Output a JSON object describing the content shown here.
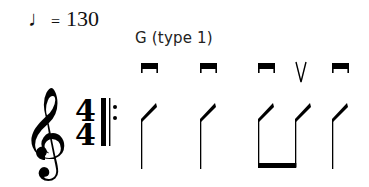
{
  "tempo": {
    "note_symbol": "♩",
    "equals": "=",
    "bpm": "130"
  },
  "chord": {
    "label": "G (type 1)"
  },
  "staff": {
    "clef": "treble-clef",
    "time_signature": {
      "top": "4",
      "bottom": "4"
    },
    "barline": "start-repeat"
  },
  "pattern": {
    "notation": "slash",
    "strokes": [
      {
        "index": 1,
        "direction": "down",
        "symbol": "down-bow",
        "beamed": false
      },
      {
        "index": 2,
        "direction": "down",
        "symbol": "down-bow",
        "beamed": false
      },
      {
        "index": 3,
        "direction": "down",
        "symbol": "down-bow",
        "beamed": true
      },
      {
        "index": 4,
        "direction": "up",
        "symbol": "up-bow",
        "beamed": true
      },
      {
        "index": 5,
        "direction": "down",
        "symbol": "down-bow",
        "beamed": false
      }
    ],
    "colors": {
      "ink": "#000000",
      "background": "#ffffff"
    }
  }
}
